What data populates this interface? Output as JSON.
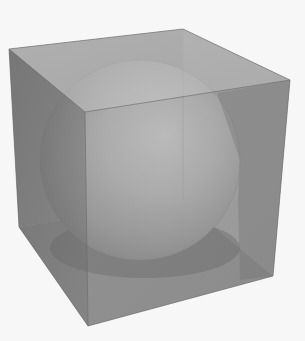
{
  "figure": {
    "background": "#f7f7f7",
    "cube": {
      "top_face_color": "#b3b3b3",
      "left_face_color": "#6e6e6e",
      "right_face_color": "#858585",
      "back_face_color": "#9a9a9a",
      "edge_color": "#5a5a5a",
      "vertices": {
        "top_left": [
          9,
          49
        ],
        "top_back": [
          183,
          29
        ],
        "top_right": [
          290,
          80
        ],
        "top_front": [
          85,
          112
        ],
        "bottom_left": [
          19,
          227
        ],
        "bottom_front": [
          88,
          326
        ],
        "bottom_right": [
          273,
          276
        ],
        "bottom_back": [
          183,
          200
        ]
      }
    },
    "sphere": {
      "center": [
        140,
        160
      ],
      "radius": 100,
      "highlight_color": "#d6d6d6",
      "mid_color": "#a8a8a8",
      "shadow_color": "#6a6a6a"
    }
  }
}
